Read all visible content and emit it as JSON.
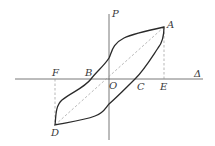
{
  "diagram": {
    "type": "hysteresis-loop",
    "axes": {
      "vertical_label": "P",
      "horizontal_label": "Δ"
    },
    "points": {
      "A": "A",
      "B": "B",
      "C": "C",
      "D": "D",
      "E": "E",
      "F": "F",
      "O": "O"
    },
    "colors": {
      "curve": "#2a2a2a",
      "axes": "#555555",
      "dashed": "#888888"
    }
  }
}
